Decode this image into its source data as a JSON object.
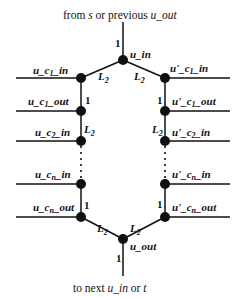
{
  "diagram": {
    "top_caption": {
      "prefix": "from ",
      "s": "s",
      "mid": " or previous ",
      "u_out": "u_out"
    },
    "bottom_caption": {
      "prefix": "to next ",
      "u_in": "u_in",
      "mid": " or ",
      "t": "t"
    },
    "nodes": {
      "u_in": "u_in",
      "u_out": "u_out"
    },
    "left_labels": {
      "c1_in": "u_c",
      "c1_in_sub": "1",
      "c1_in_suffix": "_in",
      "c1_out": "u_c",
      "c1_out_sub": "1",
      "c1_out_suffix": "_out",
      "c2_in": "u_c",
      "c2_in_sub": "2",
      "c2_in_suffix": "_in",
      "cn_in": "u_c",
      "cn_in_sub": "n",
      "cn_in_suffix": "_in",
      "cn_out": "u_c",
      "cn_out_sub": "n",
      "cn_out_suffix": "_out"
    },
    "right_labels": {
      "c1_in": "u'_c",
      "c1_in_sub": "1",
      "c1_in_suffix": "_in",
      "c1_out": "u'_c",
      "c1_out_sub": "1",
      "c1_out_suffix": "_out",
      "c2_in": "u'_c",
      "c2_in_sub": "2",
      "c2_in_suffix": "_in",
      "cn_in": "u'_c",
      "cn_in_sub": "n",
      "cn_in_suffix": "_in",
      "cn_out": "u'_c",
      "cn_out_sub": "n",
      "cn_out_suffix": "_out"
    },
    "weights": {
      "one": "1",
      "L": "L",
      "L_sub": "2"
    }
  }
}
